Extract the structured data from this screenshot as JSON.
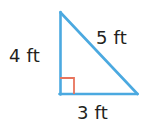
{
  "figure": {
    "kind": "right-triangle-diagram",
    "width": 146,
    "height": 132,
    "background_color": "#ffffff",
    "stroke_color": "#4ba9e0",
    "stroke_width": 2.5,
    "right_angle_color": "#e8745c",
    "label_color": "#231f20"
  },
  "triangle": {
    "vertices": {
      "apex": {
        "x": 60,
        "y": 12
      },
      "bottom_left": {
        "x": 60,
        "y": 94
      },
      "bottom_right": {
        "x": 137,
        "y": 94
      }
    },
    "right_angle_marker": {
      "at_vertex": "bottom_left",
      "size": 14
    }
  },
  "labels": {
    "leg_a": "4 ft",
    "hypotenuse": "5 ft",
    "leg_b": "3 ft"
  }
}
